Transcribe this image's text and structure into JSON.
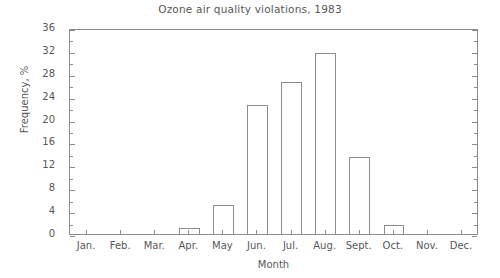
{
  "chart_data": {
    "type": "bar",
    "title": "Ozone air quality violations, 1983",
    "xlabel": "Month",
    "ylabel": "Frequency, %",
    "categories": [
      "Jan.",
      "Feb.",
      "Mar.",
      "Apr.",
      "May",
      "Jun.",
      "Jul.",
      "Aug.",
      "Sept.",
      "Oct.",
      "Nov.",
      "Dec."
    ],
    "values": [
      0,
      0,
      0,
      1,
      5,
      22.5,
      26.5,
      31.7,
      13.5,
      1.5,
      0,
      0
    ],
    "ylim": [
      0,
      36
    ],
    "xlim_categories": 12,
    "ytick_labels": [
      "0",
      "4",
      "8",
      "12",
      "16",
      "20",
      "24",
      "28",
      "32",
      "36"
    ],
    "ytick_values": [
      0,
      4,
      8,
      12,
      16,
      20,
      24,
      28,
      32,
      36
    ],
    "yminor_tick_values": [
      2,
      6,
      10,
      14,
      18,
      22,
      26,
      30,
      34
    ],
    "grid": false,
    "legend": null,
    "series_name": "Frequency of ozone air quality violations",
    "bar_fill_color": "#ffffff",
    "bar_edge_color": "#8c8c8c",
    "axis_color": "#8c8c8c",
    "text_color": "#575757"
  }
}
